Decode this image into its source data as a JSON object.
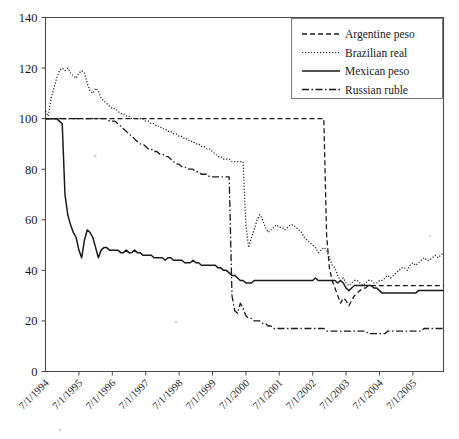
{
  "chart_data": {
    "type": "line",
    "title": "",
    "subtitle": "",
    "xlabel": "",
    "ylabel": "",
    "ylim": [
      0,
      140
    ],
    "ytick_values": [
      0,
      20,
      40,
      60,
      80,
      100,
      120,
      140
    ],
    "ytick_labels": [
      "0",
      "20",
      "40",
      "60",
      "80",
      "100",
      "120",
      "140"
    ],
    "grid": false,
    "legend_position": "top-right",
    "x_start": "7/1/1994",
    "x_end": "12/1/2005",
    "xtick_labels": [
      "7/1/1994",
      "7/1/1995",
      "7/1/1996",
      "7/1/1997",
      "7/1/1998",
      "7/1/1999",
      "7/1/2000",
      "7/1/2001",
      "7/1/2002",
      "7/1/2003",
      "7/1/2004",
      "7/1/2005"
    ],
    "series": [
      {
        "name": "Argentine peso",
        "dash": "dashed",
        "stroke_width": 1.3,
        "dasharray": "5,3",
        "values": [
          100,
          100,
          100,
          100,
          100,
          100,
          100,
          100,
          100,
          100,
          100,
          100,
          100,
          100,
          100,
          100,
          100,
          100,
          100,
          100,
          100,
          100,
          100,
          100,
          100,
          100,
          100,
          100,
          100,
          100,
          100,
          100,
          100,
          100,
          100,
          100,
          100,
          100,
          100,
          100,
          100,
          100,
          100,
          100,
          100,
          100,
          100,
          100,
          100,
          100,
          100,
          100,
          100,
          100,
          100,
          100,
          100,
          100,
          100,
          100,
          100,
          100,
          100,
          100,
          100,
          100,
          100,
          100,
          100,
          100,
          100,
          100,
          100,
          100,
          100,
          100,
          100,
          100,
          100,
          100,
          100,
          100,
          100,
          100,
          100,
          100,
          100,
          100,
          100,
          100,
          100,
          100,
          100,
          100,
          100,
          100,
          100,
          100,
          100,
          100,
          100,
          54,
          41,
          36,
          33,
          30,
          27,
          29,
          28,
          26,
          28,
          30,
          31,
          32,
          33,
          33,
          34,
          34,
          34,
          34,
          34,
          34,
          34,
          34,
          34,
          34,
          34,
          34,
          34,
          34,
          34,
          34,
          34,
          34,
          34,
          34,
          34,
          34,
          34,
          34,
          34,
          34,
          34,
          34
        ]
      },
      {
        "name": "Brazilian real",
        "dash": "dotted",
        "stroke_width": 1.2,
        "dasharray": "1.2,1.8",
        "values": [
          103,
          101,
          108,
          112,
          116,
          119,
          120,
          119,
          120,
          118,
          117,
          116,
          118,
          119,
          118,
          114,
          111,
          110,
          112,
          111,
          108,
          107,
          106,
          105,
          104,
          104,
          103,
          102,
          102,
          101,
          101,
          100,
          100,
          100,
          100,
          100,
          99,
          99,
          98,
          98,
          97,
          97,
          96,
          96,
          95,
          95,
          94,
          94,
          93,
          93,
          92,
          92,
          91,
          91,
          90,
          90,
          89,
          89,
          88,
          88,
          87,
          86,
          85,
          85,
          84,
          84,
          84,
          83,
          83,
          83,
          83,
          83,
          58,
          49,
          53,
          56,
          60,
          62,
          60,
          57,
          55,
          56,
          57,
          58,
          57,
          57,
          56,
          57,
          58,
          58,
          57,
          56,
          55,
          53,
          52,
          51,
          50,
          49,
          47,
          48,
          49,
          48,
          45,
          42,
          41,
          38,
          36,
          37,
          35,
          34,
          35,
          36,
          36,
          35,
          34,
          35,
          36,
          36,
          35,
          35,
          36,
          36,
          37,
          38,
          37,
          38,
          39,
          40,
          41,
          41,
          40,
          42,
          43,
          42,
          43,
          44,
          45,
          44,
          44,
          45,
          46,
          45,
          46,
          47
        ]
      },
      {
        "name": "Mexican peso",
        "dash": "solid",
        "stroke_width": 1.5,
        "dasharray": "",
        "values": [
          100,
          100,
          100,
          100,
          100,
          99,
          98,
          70,
          62,
          58,
          55,
          53,
          48,
          45,
          52,
          56,
          55,
          53,
          49,
          45,
          48,
          49,
          49,
          48,
          48,
          48,
          48,
          47,
          47,
          48,
          47,
          47,
          48,
          47,
          47,
          46,
          46,
          46,
          46,
          45,
          45,
          45,
          45,
          44,
          45,
          45,
          44,
          44,
          44,
          44,
          43,
          43,
          43,
          44,
          43,
          43,
          42,
          42,
          42,
          42,
          42,
          42,
          41,
          41,
          40,
          40,
          39,
          38,
          38,
          37,
          36,
          36,
          35,
          35,
          35,
          36,
          36,
          36,
          36,
          36,
          36,
          36,
          36,
          36,
          36,
          36,
          36,
          36,
          36,
          36,
          36,
          36,
          36,
          36,
          36,
          36,
          36,
          37,
          36,
          36,
          36,
          36,
          36,
          36,
          36,
          35,
          36,
          35,
          33,
          32,
          33,
          34,
          34,
          34,
          34,
          34,
          34,
          34,
          33,
          33,
          32,
          31,
          31,
          31,
          31,
          31,
          31,
          31,
          31,
          31,
          31,
          31,
          31,
          31,
          32,
          32,
          32,
          32,
          32,
          32,
          32,
          32,
          32,
          32
        ]
      },
      {
        "name": "Russian ruble",
        "dash": "dashdot",
        "stroke_width": 1.3,
        "dasharray": "7,2.5,1.5,2.5",
        "values": [
          100,
          100,
          100,
          100,
          100,
          100,
          100,
          100,
          100,
          100,
          100,
          100,
          100,
          100,
          100,
          100,
          100,
          100,
          100,
          100,
          100,
          100,
          100,
          99,
          99,
          99,
          98,
          97,
          96,
          95,
          94,
          93,
          92,
          91,
          90,
          90,
          89,
          88,
          88,
          87,
          87,
          86,
          86,
          85,
          85,
          84,
          83,
          82,
          82,
          81,
          81,
          80,
          80,
          80,
          79,
          79,
          78,
          78,
          78,
          77,
          77,
          77,
          77,
          77,
          77,
          77,
          77,
          30,
          24,
          23,
          27,
          25,
          22,
          21,
          21,
          20,
          20,
          20,
          19,
          19,
          18,
          18,
          17,
          17,
          17,
          17,
          17,
          17,
          17,
          17,
          17,
          17,
          17,
          17,
          17,
          17,
          17,
          17,
          17,
          17,
          17,
          16,
          16,
          16,
          16,
          16,
          16,
          16,
          16,
          16,
          16,
          16,
          16,
          16,
          16,
          16,
          15,
          15,
          15,
          15,
          15,
          15,
          15,
          16,
          16,
          16,
          16,
          16,
          16,
          16,
          16,
          16,
          16,
          16,
          16,
          16,
          17,
          17,
          17,
          17,
          17,
          17,
          17,
          17
        ]
      }
    ]
  },
  "legend": {
    "entries": [
      {
        "label": "Argentine peso"
      },
      {
        "label": "Brazilian real"
      },
      {
        "label": "Mexican peso"
      },
      {
        "label": "Russian ruble"
      }
    ]
  },
  "colors": {
    "line": "#1a1a1a",
    "axis": "#4a4a4a",
    "background": "#ffffff",
    "legend_border": "#6b6b6b"
  }
}
